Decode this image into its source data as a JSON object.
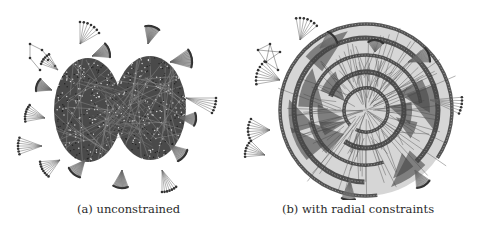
{
  "figure": {
    "panels": [
      {
        "id": "a",
        "caption": "(a) unconstrained",
        "layout": "force-directed",
        "clusters": [
          {
            "cx": 88,
            "cy": 110,
            "rx": 34,
            "ry": 52
          },
          {
            "cx": 150,
            "cy": 108,
            "rx": 36,
            "ry": 52
          }
        ],
        "fans": [
          {
            "x": 80,
            "y": 44,
            "angle": -60,
            "r": 22,
            "spread": 60,
            "n": 7,
            "sep": false
          },
          {
            "x": 92,
            "y": 56,
            "angle": -20,
            "r": 18,
            "spread": 50,
            "n": 12,
            "sep": true
          },
          {
            "x": 148,
            "y": 44,
            "angle": -75,
            "r": 18,
            "spread": 50,
            "n": 12,
            "sep": true
          },
          {
            "x": 170,
            "y": 62,
            "angle": -10,
            "r": 22,
            "spread": 50,
            "n": 12,
            "sep": true
          },
          {
            "x": 186,
            "y": 98,
            "angle": 15,
            "r": 30,
            "spread": 30,
            "n": 6,
            "sep": false
          },
          {
            "x": 180,
            "y": 118,
            "angle": 5,
            "r": 16,
            "spread": 50,
            "n": 12,
            "sep": true
          },
          {
            "x": 170,
            "y": 145,
            "angle": 40,
            "r": 18,
            "spread": 50,
            "n": 12,
            "sep": true
          },
          {
            "x": 162,
            "y": 170,
            "angle": 70,
            "r": 22,
            "spread": 40,
            "n": 7,
            "sep": false
          },
          {
            "x": 122,
            "y": 170,
            "angle": 95,
            "r": 18,
            "spread": 50,
            "n": 12,
            "sep": true
          },
          {
            "x": 85,
            "y": 160,
            "angle": 130,
            "r": 18,
            "spread": 50,
            "n": 12,
            "sep": true
          },
          {
            "x": 60,
            "y": 160,
            "angle": 150,
            "r": 20,
            "spread": 50,
            "n": 8,
            "sep": false
          },
          {
            "x": 42,
            "y": 146,
            "angle": 180,
            "r": 24,
            "spread": 40,
            "n": 7,
            "sep": false
          },
          {
            "x": 45,
            "y": 118,
            "angle": 195,
            "r": 20,
            "spread": 50,
            "n": 8,
            "sep": false
          },
          {
            "x": 52,
            "y": 90,
            "angle": 200,
            "r": 16,
            "spread": 50,
            "n": 12,
            "sep": true
          },
          {
            "x": 58,
            "y": 70,
            "angle": 220,
            "r": 18,
            "spread": 40,
            "n": 6,
            "sep": false
          }
        ]
      },
      {
        "id": "b",
        "caption": "(b) with radial constraints",
        "layout": "radial",
        "center": {
          "x": 126,
          "y": 110
        },
        "rings": [
          22,
          38,
          55,
          72,
          86
        ],
        "fans": [
          {
            "x": 60,
            "y": 40,
            "angle": -70,
            "r": 22,
            "spread": 60,
            "n": 7,
            "sep": false
          },
          {
            "x": 80,
            "y": 48,
            "angle": -40,
            "r": 18,
            "spread": 50,
            "n": 12,
            "sep": true
          },
          {
            "x": 135,
            "y": 52,
            "angle": -85,
            "r": 12,
            "spread": 80,
            "n": 12,
            "sep": true
          },
          {
            "x": 168,
            "y": 62,
            "angle": -20,
            "r": 22,
            "spread": 40,
            "n": 12,
            "sep": true
          },
          {
            "x": 190,
            "y": 100,
            "angle": 10,
            "r": 32,
            "spread": 30,
            "n": 6,
            "sep": false
          },
          {
            "x": 175,
            "y": 170,
            "angle": 60,
            "r": 18,
            "spread": 50,
            "n": 12,
            "sep": true
          },
          {
            "x": 110,
            "y": 180,
            "angle": 95,
            "r": 20,
            "spread": 40,
            "n": 12,
            "sep": true
          },
          {
            "x": 30,
            "y": 130,
            "angle": 180,
            "r": 22,
            "spread": 60,
            "n": 8,
            "sep": false
          },
          {
            "x": 25,
            "y": 155,
            "angle": 200,
            "r": 20,
            "spread": 50,
            "n": 7,
            "sep": false
          },
          {
            "x": 40,
            "y": 80,
            "angle": 200,
            "r": 24,
            "spread": 60,
            "n": 8,
            "sep": false
          }
        ]
      }
    ]
  }
}
